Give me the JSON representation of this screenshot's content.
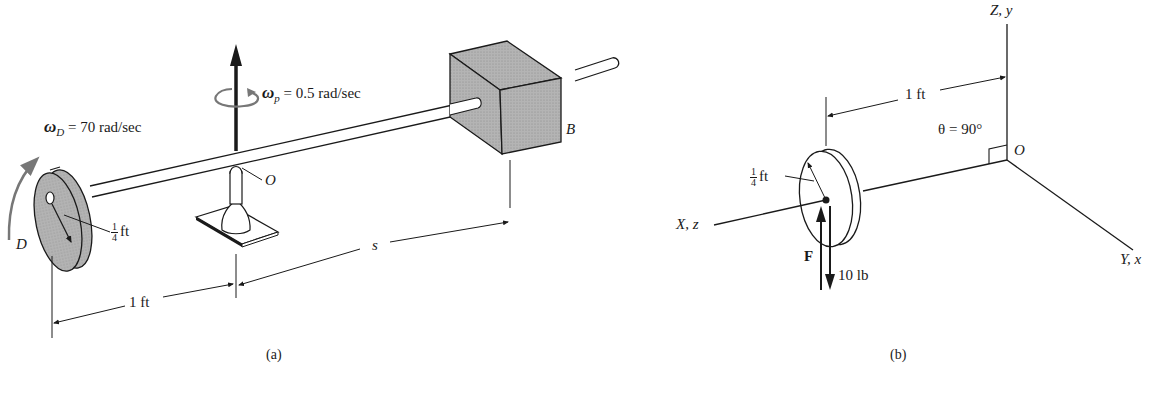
{
  "figure_a": {
    "caption": "(a)",
    "omega_D": {
      "symbol": "ω",
      "subscript": "D",
      "value": "= 70 rad/sec"
    },
    "omega_p": {
      "symbol": "ω",
      "subscript": "p",
      "value": "= 0.5 rad/sec"
    },
    "point_O": "O",
    "point_B": "B",
    "point_D": "D",
    "radius": {
      "num": "1",
      "den": "4",
      "unit": "ft"
    },
    "dim_1ft": "1 ft",
    "dim_s": "s"
  },
  "figure_b": {
    "caption": "(b)",
    "axis_Z": "Z, y",
    "axis_X": "X, z",
    "axis_Y": "Y, x",
    "point_O": "O",
    "theta": "θ = 90°",
    "dim_1ft": "1 ft",
    "radius": {
      "num": "1",
      "den": "4",
      "unit": "ft"
    },
    "force_label": "F",
    "force_value": "10 lb"
  },
  "colors": {
    "ink": "#1a1a1a",
    "fill_gray": "#a9a9a9",
    "arrow_gray": "#777777"
  }
}
